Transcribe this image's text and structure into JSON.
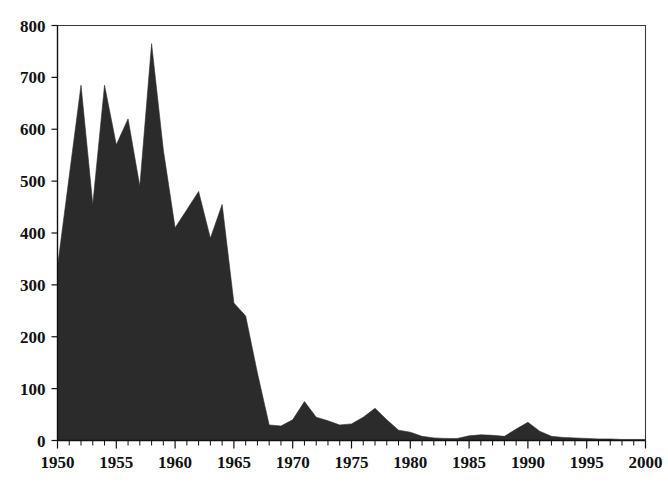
{
  "chart_data": {
    "type": "area",
    "title": "",
    "subtitle": "",
    "xlabel": "",
    "ylabel": "",
    "xlim": [
      1950,
      2000
    ],
    "ylim": [
      0,
      800
    ],
    "grid": false,
    "legend": null,
    "series_color": "#2b2b2b",
    "x_tick_labels": [
      "1950",
      "1955",
      "1960",
      "1965",
      "1970",
      "1975",
      "1980",
      "1985",
      "1990",
      "1995",
      "2000"
    ],
    "x_tick_values": [
      1950,
      1955,
      1960,
      1965,
      1970,
      1975,
      1980,
      1985,
      1990,
      1995,
      2000
    ],
    "x_minor_tick_interval": 1,
    "y_tick_labels": [
      "0",
      "100",
      "200",
      "300",
      "400",
      "500",
      "600",
      "700",
      "800"
    ],
    "y_tick_values": [
      0,
      100,
      200,
      300,
      400,
      500,
      600,
      700,
      800
    ],
    "x": [
      1950,
      1951,
      1952,
      1953,
      1954,
      1955,
      1956,
      1957,
      1958,
      1959,
      1960,
      1961,
      1962,
      1963,
      1964,
      1965,
      1966,
      1967,
      1968,
      1969,
      1970,
      1971,
      1972,
      1973,
      1974,
      1975,
      1976,
      1977,
      1978,
      1979,
      1980,
      1981,
      1982,
      1983,
      1984,
      1985,
      1986,
      1987,
      1988,
      1989,
      1990,
      1991,
      1992,
      1993,
      1994,
      1995,
      1996,
      1997,
      1998,
      1999,
      2000
    ],
    "values": [
      335,
      510,
      685,
      455,
      685,
      570,
      620,
      490,
      765,
      560,
      410,
      445,
      480,
      390,
      455,
      265,
      240,
      130,
      30,
      28,
      40,
      75,
      45,
      38,
      30,
      32,
      45,
      62,
      40,
      20,
      16,
      8,
      5,
      4,
      4,
      9,
      11,
      10,
      8,
      22,
      35,
      18,
      8,
      6,
      5,
      4,
      3,
      3,
      2,
      2,
      2
    ],
    "series": [
      {
        "name": "series-1",
        "values": [
          335,
          510,
          685,
          455,
          685,
          570,
          620,
          490,
          765,
          560,
          410,
          445,
          480,
          390,
          455,
          265,
          240,
          130,
          30,
          28,
          40,
          75,
          45,
          38,
          30,
          32,
          45,
          62,
          40,
          20,
          16,
          8,
          5,
          4,
          4,
          9,
          11,
          10,
          8,
          22,
          35,
          18,
          8,
          6,
          5,
          4,
          3,
          3,
          2,
          2,
          2
        ]
      }
    ]
  }
}
